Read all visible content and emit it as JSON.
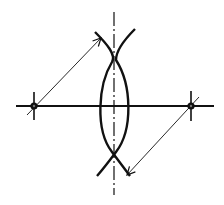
{
  "diagram": {
    "type": "perpendicular-bisector-construction",
    "colors": {
      "ink": "#111111",
      "background": "#ffffff"
    },
    "segment": {
      "x1": 16,
      "y1": 106,
      "x2": 214,
      "y2": 106
    },
    "points": [
      {
        "name": "left-endpoint",
        "x": 34,
        "y": 106
      },
      {
        "name": "right-endpoint",
        "x": 191,
        "y": 106
      }
    ],
    "axis": {
      "x": 114,
      "y1": 12,
      "y2": 195
    },
    "arcs": [
      {
        "name": "left-arc",
        "path": "M95,32 Q80,106 97,176"
      },
      {
        "name": "right-arc",
        "path": "M135,29 Q148,106 128,176"
      }
    ],
    "crossing_arcs": [
      {
        "name": "top-left-tail",
        "path": "M95,32 Q106,42 114,55"
      },
      {
        "name": "top-right-tail",
        "path": "M135,29 Q122,40 114,55"
      }
    ],
    "radius_arrows": [
      {
        "name": "left-radius-arrow",
        "x1": 27,
        "y1": 115,
        "x2": 100,
        "y2": 38
      },
      {
        "name": "right-radius-arrow",
        "x1": 198,
        "y1": 97,
        "x2": 127,
        "y2": 175
      }
    ]
  }
}
